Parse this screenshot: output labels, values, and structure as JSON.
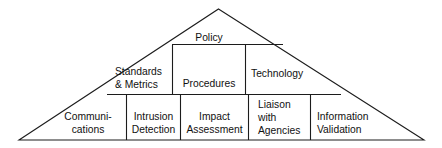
{
  "diagram": {
    "shape": "triangle",
    "background_color": "#ffffff",
    "line_color": "#1c1c1c",
    "text_color": "#111111",
    "tiers": [
      {
        "tier_index": 1,
        "name": "top-tier",
        "cells": [
          {
            "id": "policy",
            "lines": [
              "Policy"
            ]
          }
        ]
      },
      {
        "tier_index": 2,
        "name": "middle-tier",
        "cells": [
          {
            "id": "standards-metrics",
            "lines": [
              "Standards",
              "& Metrics"
            ]
          },
          {
            "id": "procedures",
            "lines": [
              "Procedures"
            ]
          },
          {
            "id": "technology",
            "lines": [
              "Technology"
            ]
          }
        ]
      },
      {
        "tier_index": 3,
        "name": "bottom-tier",
        "cells": [
          {
            "id": "communications",
            "lines": [
              "Communi-",
              "cations"
            ]
          },
          {
            "id": "intrusion-detection",
            "lines": [
              "Intrusion",
              "Detection"
            ]
          },
          {
            "id": "impact-assessment",
            "lines": [
              "Impact",
              "Assessment"
            ]
          },
          {
            "id": "liaison-with-agencies",
            "lines": [
              "Liaison",
              "with",
              "Agencies"
            ]
          },
          {
            "id": "information-validation",
            "lines": [
              "Information",
              "Validation"
            ]
          }
        ]
      }
    ],
    "labels": {
      "policy": "Policy",
      "standards_line1": "Standards",
      "standards_line2": "& Metrics",
      "procedures": "Procedures",
      "technology": "Technology",
      "communications_line1": "Communi-",
      "communications_line2": "cations",
      "intrusion_line1": "Intrusion",
      "intrusion_line2": "Detection",
      "impact_line1": "Impact",
      "impact_line2": "Assessment",
      "liaison_line1": "Liaison",
      "liaison_line2": "with",
      "liaison_line3": "Agencies",
      "information_line1": "Information",
      "information_line2": "Validation"
    }
  }
}
